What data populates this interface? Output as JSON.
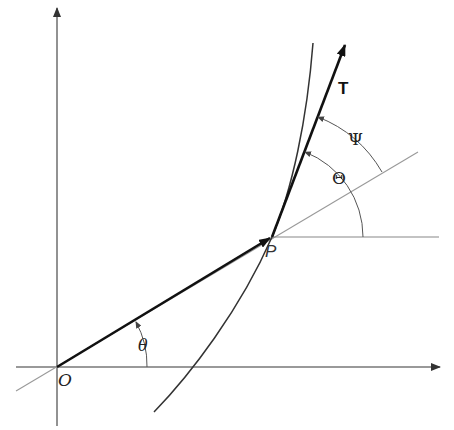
{
  "colors": {
    "background": "#ffffff",
    "axis": "#777777",
    "thin_line": "#888888",
    "vector": "#1a1a1a",
    "curve": "#333333",
    "label": "#222222"
  },
  "labels": {
    "origin": "O",
    "point": "P",
    "polar_angle": "θ",
    "tangent": "T",
    "tangent_angle": "Θ",
    "psi_angle": "Ψ"
  },
  "geometry": {
    "origin": [
      57,
      367
    ],
    "point_p": [
      272,
      237
    ],
    "tangent_tip": [
      346,
      42
    ]
  }
}
